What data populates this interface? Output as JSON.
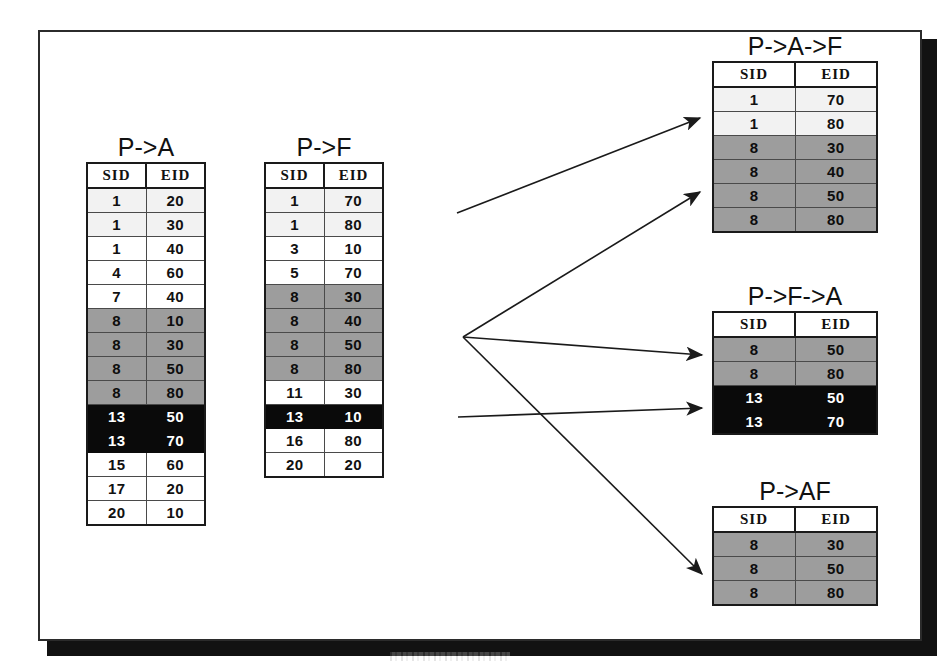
{
  "diagram": {
    "columns": [
      "SID",
      "EID"
    ]
  },
  "tables": {
    "p_a": {
      "title": "P->A",
      "columns": [
        "SID",
        "EID"
      ],
      "rows": [
        {
          "sid": "1",
          "eid": "20",
          "style": "faint"
        },
        {
          "sid": "1",
          "eid": "30",
          "style": "faint"
        },
        {
          "sid": "1",
          "eid": "40",
          "style": "plain"
        },
        {
          "sid": "4",
          "eid": "60",
          "style": "plain"
        },
        {
          "sid": "7",
          "eid": "40",
          "style": "plain"
        },
        {
          "sid": "8",
          "eid": "10",
          "style": "gray"
        },
        {
          "sid": "8",
          "eid": "30",
          "style": "gray"
        },
        {
          "sid": "8",
          "eid": "50",
          "style": "gray"
        },
        {
          "sid": "8",
          "eid": "80",
          "style": "gray"
        },
        {
          "sid": "13",
          "eid": "50",
          "style": "black"
        },
        {
          "sid": "13",
          "eid": "70",
          "style": "black"
        },
        {
          "sid": "15",
          "eid": "60",
          "style": "plain"
        },
        {
          "sid": "17",
          "eid": "20",
          "style": "plain"
        },
        {
          "sid": "20",
          "eid": "10",
          "style": "plain"
        }
      ]
    },
    "p_f": {
      "title": "P->F",
      "columns": [
        "SID",
        "EID"
      ],
      "rows": [
        {
          "sid": "1",
          "eid": "70",
          "style": "faint"
        },
        {
          "sid": "1",
          "eid": "80",
          "style": "faint"
        },
        {
          "sid": "3",
          "eid": "10",
          "style": "plain"
        },
        {
          "sid": "5",
          "eid": "70",
          "style": "plain"
        },
        {
          "sid": "8",
          "eid": "30",
          "style": "gray"
        },
        {
          "sid": "8",
          "eid": "40",
          "style": "gray"
        },
        {
          "sid": "8",
          "eid": "50",
          "style": "gray"
        },
        {
          "sid": "8",
          "eid": "80",
          "style": "gray"
        },
        {
          "sid": "11",
          "eid": "30",
          "style": "plain"
        },
        {
          "sid": "13",
          "eid": "10",
          "style": "black"
        },
        {
          "sid": "16",
          "eid": "80",
          "style": "plain"
        },
        {
          "sid": "20",
          "eid": "20",
          "style": "plain"
        }
      ]
    },
    "p_a_f": {
      "title": "P->A->F",
      "columns": [
        "SID",
        "EID"
      ],
      "rows": [
        {
          "sid": "1",
          "eid": "70",
          "style": "faint"
        },
        {
          "sid": "1",
          "eid": "80",
          "style": "faint"
        },
        {
          "sid": "8",
          "eid": "30",
          "style": "gray"
        },
        {
          "sid": "8",
          "eid": "40",
          "style": "gray"
        },
        {
          "sid": "8",
          "eid": "50",
          "style": "gray"
        },
        {
          "sid": "8",
          "eid": "80",
          "style": "gray"
        }
      ]
    },
    "p_f_a": {
      "title": "P->F->A",
      "columns": [
        "SID",
        "EID"
      ],
      "rows": [
        {
          "sid": "8",
          "eid": "50",
          "style": "gray"
        },
        {
          "sid": "8",
          "eid": "80",
          "style": "gray"
        },
        {
          "sid": "13",
          "eid": "50",
          "style": "black"
        },
        {
          "sid": "13",
          "eid": "70",
          "style": "black"
        }
      ]
    },
    "p_af": {
      "title": "P->AF",
      "columns": [
        "SID",
        "EID"
      ],
      "rows": [
        {
          "sid": "8",
          "eid": "30",
          "style": "gray"
        },
        {
          "sid": "8",
          "eid": "50",
          "style": "gray"
        },
        {
          "sid": "8",
          "eid": "80",
          "style": "gray"
        }
      ]
    }
  },
  "arrows": [
    {
      "name": "arrow-to-p-a-f-top",
      "x1": 457,
      "y1": 213,
      "x2": 700,
      "y2": 118
    },
    {
      "name": "arrow-to-p-a-f-bottom",
      "x1": 463,
      "y1": 337,
      "x2": 700,
      "y2": 192
    },
    {
      "name": "arrow-to-p-f-a-top",
      "x1": 463,
      "y1": 337,
      "x2": 702,
      "y2": 355
    },
    {
      "name": "arrow-to-p-f-a-bottom",
      "x1": 458,
      "y1": 417,
      "x2": 702,
      "y2": 408
    },
    {
      "name": "arrow-to-p-af",
      "x1": 463,
      "y1": 337,
      "x2": 702,
      "y2": 574
    }
  ],
  "colors": {
    "frame_border": "#2b2b2b",
    "frame_shadow": "#121212",
    "row_highlight_gray": "#9d9d9d",
    "row_highlight_black": "#0a0a0a",
    "row_faint": "#f2f2f2",
    "text": "#111111",
    "arrow": "#1a1a1a"
  }
}
